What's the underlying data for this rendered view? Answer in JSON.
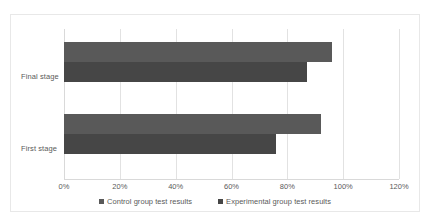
{
  "chart_data": {
    "type": "bar",
    "orientation": "horizontal",
    "title": "",
    "xlabel": "",
    "ylabel": "",
    "categories": [
      "Final stage",
      "First stage"
    ],
    "series": [
      {
        "name": "Control group test results",
        "color": "#595959",
        "values": [
          96,
          92
        ]
      },
      {
        "name": "Experimental group test results",
        "color": "#464646",
        "values": [
          87,
          76
        ]
      }
    ],
    "xlim": [
      0,
      120
    ],
    "xticks": [
      0,
      20,
      40,
      60,
      80,
      100,
      120
    ],
    "xtick_labels": [
      "0%",
      "20%",
      "40%",
      "60%",
      "80%",
      "100%",
      "120%"
    ],
    "grid": true,
    "legend_position": "bottom",
    "value_unit": "%"
  },
  "axis": {
    "ticks": [
      {
        "value": 0,
        "label": "0%"
      },
      {
        "value": 20,
        "label": "20%"
      },
      {
        "value": 40,
        "label": "40%"
      },
      {
        "value": 60,
        "label": "60%"
      },
      {
        "value": 80,
        "label": "80%"
      },
      {
        "value": 100,
        "label": "100%"
      },
      {
        "value": 120,
        "label": "120%"
      }
    ]
  },
  "categories": [
    {
      "label": "Final stage"
    },
    {
      "label": "First stage"
    }
  ],
  "legend": {
    "items": [
      {
        "label": "Control group test results",
        "color": "#595959"
      },
      {
        "label": "Experimental group test results",
        "color": "#464646"
      }
    ]
  },
  "colors": {
    "control": "#595959",
    "experimental": "#464646",
    "gridline": "#e2e2e2",
    "frame_border": "#e8e8e8",
    "text": "#5a5a5a",
    "background": "#ffffff"
  }
}
